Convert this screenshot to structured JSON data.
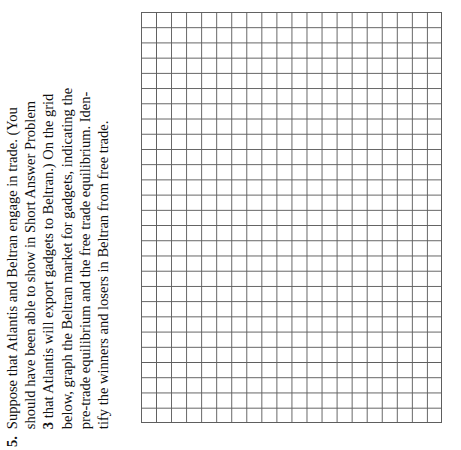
{
  "page": {
    "background_color": "#ffffff",
    "text_color": "#111111"
  },
  "question": {
    "number": "5.",
    "full_text": "Suppose that Atlantis and Beltran engage in trade. (You should have been able to show in Short Answer Problem 3 that Atlantis will export gadgets to Beltran.) On the grid below, graph the Beltran market for gadgets, indicating the pre-trade equilibrium and the free trade equilibrium. Identify the winners and losers in Beltran from free trade.",
    "lines": [
      "Suppose that Atlantis and Beltran engage in trade. (You",
      "should have been able to show in Short Answer Problem",
      "that Atlantis will export gadgets to Beltran.) On the grid",
      "below, graph the Beltran market for gadgets, indicating the",
      "pre-trade equilibrium and the free trade equilibrium. Iden-",
      "tify the winners and losers in Beltran from free trade."
    ],
    "bold_reference": "3",
    "orientation": "rotated-90-ccw"
  },
  "grid": {
    "columns": 20,
    "rows": 27,
    "line_color": "#5e5e5e",
    "fill_color": "#ffffff",
    "cell_width_px": 15.05,
    "cell_height_px": 15.22,
    "left_px": 141,
    "top_px": 12,
    "width_px": 301,
    "height_px": 411
  }
}
